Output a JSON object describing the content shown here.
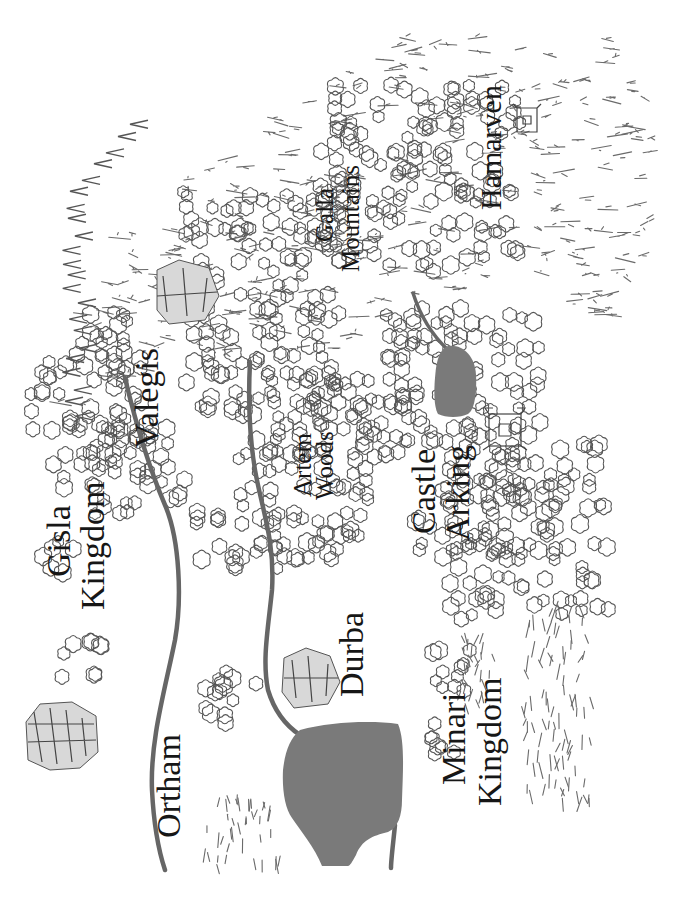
{
  "map": {
    "orientation": "rotated-90-ccw",
    "colors": {
      "background": "#ffffff",
      "water": "#7a7a7a",
      "river": "#666666",
      "ink": "#161616",
      "terrain": "#6a6a6a"
    },
    "labels": {
      "gisla_kingdom": [
        "Gisla",
        "Kingdom"
      ],
      "ortham": "Ortham",
      "valegis": "Valegis",
      "galla_mountains": [
        "Galla",
        "Mountains"
      ],
      "hamarven": "Hamarven",
      "artem_woods": [
        "Artem",
        "Woods"
      ],
      "castle_arking": [
        "Castle",
        "Arking"
      ],
      "durba": "Durba",
      "minari_kingdom": [
        "Minari",
        "Kingdom"
      ]
    },
    "features": [
      {
        "type": "city",
        "name": "Ortham",
        "icon": "walled-city-icon"
      },
      {
        "type": "city",
        "name": "Valegis",
        "icon": "walled-city-icon"
      },
      {
        "type": "city",
        "name": "Durba",
        "icon": "walled-city-icon"
      },
      {
        "type": "town",
        "name": "Hamarven",
        "icon": "town-icon"
      },
      {
        "type": "castle",
        "name": "Castle Arking",
        "icon": "castle-icon"
      },
      {
        "type": "region",
        "name": "Gisla Kingdom"
      },
      {
        "type": "region",
        "name": "Minari Kingdom"
      },
      {
        "type": "mountains",
        "name": "Galla Mountains"
      },
      {
        "type": "forest",
        "name": "Artem Woods"
      },
      {
        "type": "lake",
        "name": "Great Lake"
      },
      {
        "type": "lake",
        "name": "Arking Lake"
      }
    ]
  }
}
